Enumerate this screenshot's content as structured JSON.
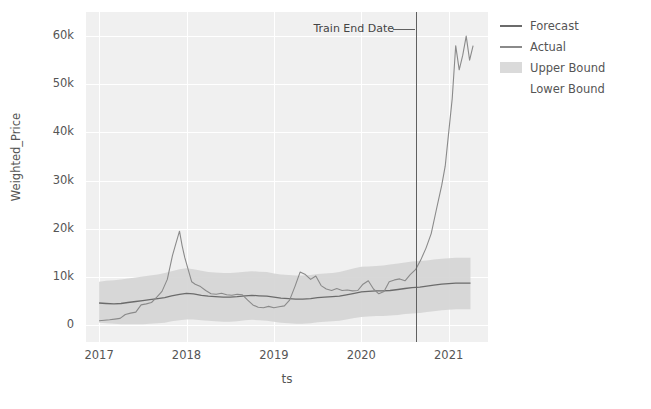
{
  "chart_data": {
    "type": "line",
    "title": "",
    "xlabel": "ts",
    "ylabel": "Weighted_Price",
    "xlim": [
      2016.85,
      2021.45
    ],
    "ylim": [
      -3500,
      65000
    ],
    "grid": true,
    "legend_position": "right",
    "xticks": [
      "2017",
      "2018",
      "2019",
      "2020",
      "2021"
    ],
    "xtick_values": [
      2017,
      2018,
      2019,
      2020,
      2021
    ],
    "yticks": [
      "0",
      "10k",
      "20k",
      "30k",
      "40k",
      "50k",
      "60k"
    ],
    "ytick_values": [
      0,
      10000,
      20000,
      30000,
      40000,
      50000,
      60000
    ],
    "annotations": [
      {
        "label": "Train End Date",
        "x": 2020.62
      }
    ],
    "legend": [
      {
        "name": "Forecast",
        "color": "#6b6b6b",
        "style": "line"
      },
      {
        "name": "Actual",
        "color": "#8a8a8a",
        "style": "line"
      },
      {
        "name": "Upper Bound",
        "color": "#d4d4d4",
        "style": "band"
      },
      {
        "name": "Lower Bound",
        "color": "#d4d4d4",
        "style": "band"
      }
    ],
    "series": [
      {
        "name": "Forecast",
        "color": "#6b6b6b",
        "x": [
          2017.0,
          2017.08,
          2017.17,
          2017.25,
          2017.33,
          2017.42,
          2017.5,
          2017.58,
          2017.67,
          2017.75,
          2017.83,
          2017.92,
          2018.0,
          2018.08,
          2018.17,
          2018.25,
          2018.33,
          2018.42,
          2018.5,
          2018.58,
          2018.67,
          2018.75,
          2018.83,
          2018.92,
          2019.0,
          2019.08,
          2019.17,
          2019.25,
          2019.33,
          2019.42,
          2019.5,
          2019.58,
          2019.67,
          2019.75,
          2019.83,
          2019.92,
          2020.0,
          2020.08,
          2020.17,
          2020.25,
          2020.33,
          2020.42,
          2020.5,
          2020.58,
          2020.67,
          2020.75,
          2020.83,
          2020.92,
          2021.0,
          2021.08,
          2021.17,
          2021.25
        ],
        "values": [
          4600,
          4500,
          4400,
          4500,
          4700,
          4900,
          5100,
          5300,
          5500,
          5700,
          6100,
          6400,
          6600,
          6500,
          6200,
          6000,
          5900,
          5800,
          5800,
          5900,
          6100,
          6200,
          6100,
          6000,
          5800,
          5600,
          5500,
          5400,
          5400,
          5500,
          5700,
          5800,
          5900,
          6000,
          6300,
          6600,
          6900,
          7000,
          7100,
          7100,
          7200,
          7400,
          7600,
          7800,
          7900,
          8100,
          8300,
          8500,
          8600,
          8700,
          8700,
          8700
        ]
      },
      {
        "name": "Actual",
        "color": "#8a8a8a",
        "x": [
          2017.0,
          2017.06,
          2017.12,
          2017.18,
          2017.24,
          2017.3,
          2017.36,
          2017.42,
          2017.48,
          2017.54,
          2017.6,
          2017.66,
          2017.72,
          2017.78,
          2017.84,
          2017.88,
          2017.92,
          2017.95,
          2017.98,
          2018.02,
          2018.06,
          2018.1,
          2018.16,
          2018.22,
          2018.28,
          2018.34,
          2018.4,
          2018.46,
          2018.52,
          2018.58,
          2018.64,
          2018.7,
          2018.76,
          2018.82,
          2018.88,
          2018.94,
          2019.0,
          2019.06,
          2019.12,
          2019.18,
          2019.24,
          2019.3,
          2019.36,
          2019.42,
          2019.48,
          2019.54,
          2019.6,
          2019.66,
          2019.72,
          2019.78,
          2019.84,
          2019.9,
          2019.96,
          2020.02,
          2020.08,
          2020.14,
          2020.2,
          2020.26,
          2020.32,
          2020.38,
          2020.44,
          2020.5,
          2020.56,
          2020.62,
          2020.68,
          2020.74,
          2020.8,
          2020.86,
          2020.92,
          2020.96,
          2021.0,
          2021.04,
          2021.08,
          2021.12,
          2021.16,
          2021.2,
          2021.24,
          2021.28
        ],
        "values": [
          900,
          1000,
          1100,
          1250,
          1400,
          2200,
          2500,
          2700,
          4200,
          4400,
          4700,
          5800,
          7000,
          9500,
          14500,
          17000,
          19500,
          16500,
          14000,
          11500,
          9000,
          8500,
          8000,
          7200,
          6500,
          6400,
          6600,
          6300,
          6200,
          6400,
          6300,
          5200,
          4200,
          3700,
          3600,
          3900,
          3600,
          3800,
          4000,
          5200,
          8000,
          11000,
          10500,
          9500,
          10200,
          8200,
          7500,
          7200,
          7600,
          7200,
          7300,
          7100,
          7200,
          8500,
          9200,
          7500,
          6500,
          7000,
          9000,
          9400,
          9600,
          9200,
          10500,
          11500,
          13500,
          16000,
          19000,
          24000,
          29000,
          33000,
          40000,
          47000,
          58000,
          53000,
          56000,
          60000,
          55000,
          58000
        ]
      }
    ],
    "bands": [
      {
        "name": "Bounds",
        "color": "#d4d4d4",
        "x": [
          2017.0,
          2017.08,
          2017.17,
          2017.25,
          2017.33,
          2017.42,
          2017.5,
          2017.58,
          2017.67,
          2017.75,
          2017.83,
          2017.92,
          2018.0,
          2018.08,
          2018.17,
          2018.25,
          2018.33,
          2018.42,
          2018.5,
          2018.58,
          2018.67,
          2018.75,
          2018.83,
          2018.92,
          2019.0,
          2019.08,
          2019.17,
          2019.25,
          2019.33,
          2019.42,
          2019.5,
          2019.58,
          2019.67,
          2019.75,
          2019.83,
          2019.92,
          2020.0,
          2020.08,
          2020.17,
          2020.25,
          2020.33,
          2020.42,
          2020.5,
          2020.58,
          2020.67,
          2020.75,
          2020.83,
          2020.92,
          2021.0,
          2021.08,
          2021.17,
          2021.25
        ],
        "upper": [
          9000,
          9200,
          9300,
          9500,
          9700,
          9900,
          10100,
          10300,
          10500,
          10800,
          11200,
          11600,
          11800,
          11600,
          11300,
          11000,
          10900,
          10800,
          10800,
          10900,
          11100,
          11200,
          11100,
          11000,
          10700,
          10500,
          10400,
          10300,
          10300,
          10400,
          10600,
          10700,
          10800,
          11000,
          11400,
          11800,
          12100,
          12200,
          12300,
          12400,
          12600,
          12800,
          13000,
          13200,
          13300,
          13400,
          13600,
          13800,
          13900,
          14000,
          14000,
          14000
        ],
        "lower": [
          500,
          400,
          300,
          200,
          200,
          200,
          200,
          300,
          400,
          500,
          800,
          1000,
          1200,
          1200,
          1000,
          900,
          800,
          700,
          700,
          800,
          1000,
          1100,
          1000,
          900,
          700,
          500,
          400,
          300,
          300,
          400,
          600,
          700,
          800,
          900,
          1200,
          1500,
          1700,
          1800,
          1900,
          1900,
          2000,
          2100,
          2300,
          2400,
          2500,
          2700,
          2900,
          3100,
          3200,
          3300,
          3300,
          3300
        ]
      }
    ]
  }
}
